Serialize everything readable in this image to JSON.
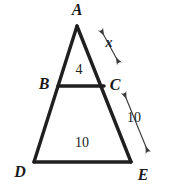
{
  "figure": {
    "kind": "geometry-diagram",
    "background_color": "#ffffff",
    "stroke_color": "#1f1f1f",
    "label_color": "#1a1a1a",
    "vertices": [
      {
        "name": "A",
        "label": "A",
        "x": 77,
        "y": 26,
        "label_x": 77,
        "label_y": 10
      },
      {
        "name": "B",
        "label": "B",
        "x": 58,
        "y": 86,
        "label_x": 44,
        "label_y": 84
      },
      {
        "name": "C",
        "label": "C",
        "x": 104,
        "y": 86,
        "label_x": 115,
        "label_y": 85
      },
      {
        "name": "D",
        "label": "D",
        "x": 34,
        "y": 162,
        "label_x": 20,
        "label_y": 172
      },
      {
        "name": "E",
        "label": "E",
        "x": 131,
        "y": 162,
        "label_x": 143,
        "label_y": 175
      }
    ],
    "segments": [
      {
        "name": "side-AD",
        "from": "A",
        "to": "D"
      },
      {
        "name": "side-AE",
        "from": "A",
        "to": "E"
      },
      {
        "name": "base-DE",
        "from": "D",
        "to": "E"
      },
      {
        "name": "midsegment-BC",
        "from": "B",
        "to": "C"
      }
    ],
    "measure_labels": [
      {
        "name": "bc-length",
        "text": "4",
        "x": 79,
        "y": 70
      },
      {
        "name": "de-length",
        "text": "10",
        "x": 82,
        "y": 143
      },
      {
        "name": "ac-length",
        "text": "x",
        "x": 109,
        "y": 43
      },
      {
        "name": "ce-length",
        "text": "10",
        "x": 134,
        "y": 118
      }
    ],
    "dimension_arrows": [
      {
        "name": "ac-dimension-arrow",
        "for": "x",
        "x1": 101,
        "y1": 30,
        "x2": 119,
        "y2": 63,
        "double_headed": true
      },
      {
        "name": "ce-dimension-arrow",
        "for": "10",
        "x1": 124,
        "y1": 93,
        "x2": 148,
        "y2": 152,
        "double_headed": true
      }
    ]
  }
}
